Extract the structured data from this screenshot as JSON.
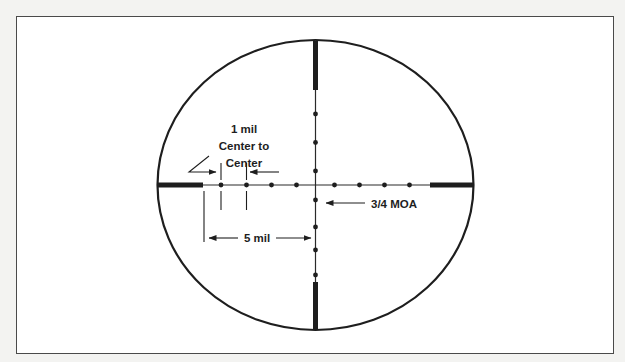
{
  "figure": {
    "frame_color": "#4a4a4a",
    "line_color": "#1e1e1e",
    "background": "#ffffff"
  },
  "labels": {
    "one_mil_line1": "1 mil",
    "one_mil_line2": "Center to",
    "one_mil_line3": "Center",
    "dot_size": "3/4 MOA",
    "five_mil": "5 mil"
  },
  "reticle": {
    "type": "mil-dot",
    "dots_per_half_axis": 4,
    "dot_spacing": "1 mil center to center",
    "dot_diameter": "3/4 MOA",
    "post_to_center": "5 mil",
    "thick_posts": [
      "top",
      "bottom",
      "left",
      "right"
    ]
  }
}
